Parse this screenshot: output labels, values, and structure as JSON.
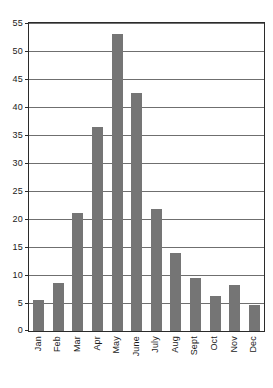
{
  "chart_data": {
    "type": "bar",
    "title": "",
    "subtitle": "",
    "xlabel": "",
    "ylabel": "",
    "categories": [
      "Jan",
      "Feb",
      "Mar",
      "Apr",
      "May",
      "June",
      "July",
      "Aug",
      "Sept",
      "Oct",
      "Nov",
      "Dec"
    ],
    "values": [
      5.5,
      8.5,
      21.0,
      36.5,
      53.0,
      42.5,
      21.7,
      14.0,
      9.5,
      6.3,
      8.3,
      4.7
    ],
    "ylim": [
      0,
      55
    ],
    "ytick_step": 5,
    "ytick_labels": [
      "0",
      "5",
      "10",
      "15",
      "20",
      "25",
      "30",
      "35",
      "40",
      "45",
      "50",
      "55"
    ],
    "ytick_values": [
      0,
      5,
      10,
      15,
      20,
      25,
      30,
      35,
      40,
      45,
      50,
      55
    ],
    "grid": true,
    "legend": false,
    "legend_position": "none",
    "bar_color": "#757575",
    "grid_color": "#6f6f6f",
    "axis_color": "#2b2b2b",
    "background_color": "#ffffff",
    "xlabel_rotation": -90
  }
}
